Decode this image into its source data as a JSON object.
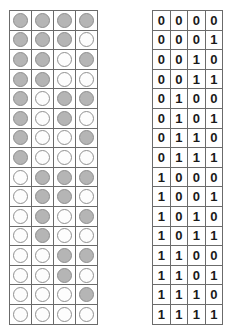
{
  "figure": {
    "name": "binary-enumeration-figure",
    "rows": 16,
    "columns": 4,
    "colors": {
      "token_zero_fill": "#b5b5b5",
      "token_one_fill": "#fdfdfd",
      "token_stroke": "#8a8a8a",
      "cell_border": "#6b6b6b",
      "grid_border": "#5a5a5a",
      "digit_color": "#1a1a1a",
      "background": "#ffffff"
    }
  },
  "legend": {
    "filled_means": "0",
    "empty_means": "1"
  },
  "chart_data": {
    "type": "table",
    "title": "",
    "xlabel": "",
    "ylabel": "",
    "columns": [
      "bit3",
      "bit2",
      "bit1",
      "bit0"
    ],
    "encoding": {
      "0": "gray filled circle",
      "1": "white empty circle"
    },
    "rows": [
      [
        0,
        0,
        0,
        0
      ],
      [
        0,
        0,
        0,
        1
      ],
      [
        0,
        0,
        1,
        0
      ],
      [
        0,
        0,
        1,
        1
      ],
      [
        0,
        1,
        0,
        0
      ],
      [
        0,
        1,
        0,
        1
      ],
      [
        0,
        1,
        1,
        0
      ],
      [
        0,
        1,
        1,
        1
      ],
      [
        1,
        0,
        0,
        0
      ],
      [
        1,
        0,
        0,
        1
      ],
      [
        1,
        0,
        1,
        0
      ],
      [
        1,
        0,
        1,
        1
      ],
      [
        1,
        1,
        0,
        0
      ],
      [
        1,
        1,
        0,
        1
      ],
      [
        1,
        1,
        1,
        0
      ],
      [
        1,
        1,
        1,
        1
      ]
    ]
  }
}
